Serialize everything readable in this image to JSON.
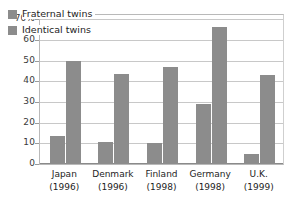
{
  "chart_data": {
    "type": "bar",
    "title": "",
    "subtitle": "",
    "xlabel": "",
    "ylabel": "",
    "ylim": [
      0,
      72
    ],
    "grid": true,
    "legend_position": "top-left",
    "categories": [
      "Japan\n(1996)",
      "Denmark\n(1996)",
      "Finland\n(1998)",
      "Germany\n(1998)",
      "U.K.\n(1999)"
    ],
    "category_names": [
      "Japan",
      "Denmark",
      "Finland",
      "Germany",
      "U.K."
    ],
    "category_years": [
      "(1996)",
      "(1996)",
      "(1998)",
      "(1998)",
      "(1999)"
    ],
    "yticks": [
      "0",
      "10",
      "20",
      "30",
      "40",
      "50",
      "60",
      "70%"
    ],
    "ytick_values": [
      0,
      10,
      20,
      30,
      40,
      50,
      60,
      70
    ],
    "series": [
      {
        "name": "Fraternal twins",
        "color": "#8c8c8c",
        "values": [
          13.5,
          10.5,
          10,
          29,
          5
        ]
      },
      {
        "name": "Identical twins",
        "color": "#8c8c8c",
        "values": [
          50,
          43.5,
          47,
          66,
          43
        ]
      }
    ]
  },
  "legend": {
    "items": [
      {
        "label": "Fraternal twins"
      },
      {
        "label": "Identical twins"
      }
    ]
  },
  "colors": {
    "bar": "#8c8c8c",
    "gridline": "#c8c8c8",
    "axis": "#8a8a8a",
    "text": "#1d1d1d",
    "background": "#ffffff"
  }
}
